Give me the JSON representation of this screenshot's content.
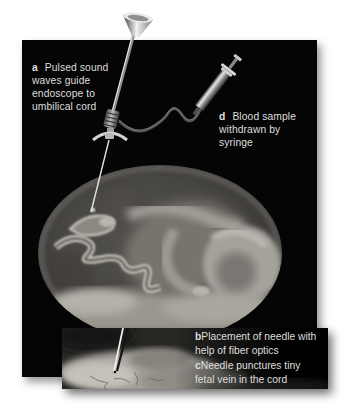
{
  "figure": {
    "colors": {
      "background": "#ffffff",
      "panel": "#050505",
      "label_text": "#dedede",
      "inset_background": "#000000",
      "metal_light": "#e8e8e6",
      "tissue_light": "#b3b0aa"
    }
  },
  "labels": {
    "a": {
      "key": "a",
      "lines": [
        "Pulsed sound",
        "waves guide",
        "endoscope to",
        "umbilical cord"
      ]
    },
    "d": {
      "key": "d",
      "lines": [
        "Blood sample",
        "withdrawn by",
        "syringe"
      ]
    },
    "b": {
      "key": "b",
      "lines": [
        "Placement of needle with",
        "help of fiber optics"
      ]
    },
    "c": {
      "key": "c",
      "lines": [
        "Needle punctures tiny",
        "fetal vein in the cord"
      ]
    }
  },
  "illustration": {
    "parts": [
      "endoscope-funnel",
      "endoscope-shaft",
      "endoscope-grip",
      "stabilizer-wings",
      "needle",
      "connecting-tube",
      "syringe",
      "uterus-oval-photo",
      "fetus-head",
      "fetus-body",
      "umbilical-cord",
      "placenta",
      "inset-cord-closeup",
      "inset-needle"
    ]
  }
}
